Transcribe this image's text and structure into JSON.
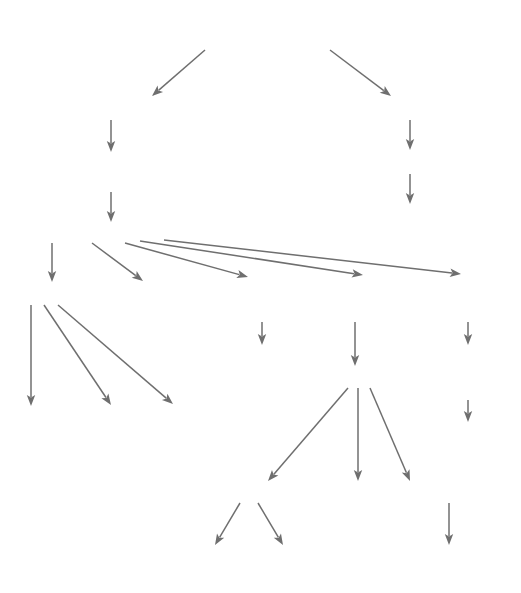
{
  "meta": {
    "background_color": "#ffffff",
    "text_color": "#3b3b3b",
    "title_color": "#4a4a4a",
    "edge_color": "#6f6f6f"
  },
  "chart_data": {
    "type": "diagram",
    "nodes": [
      {
        "id": "cold",
        "label": "local application of cold",
        "x": 262,
        "y": 40,
        "role": "title"
      },
      {
        "id": "bodytemp",
        "label": "↓ body temperature",
        "x": 111,
        "y": 111,
        "role": "node"
      },
      {
        "id": "heatcons",
        "label": "↑ heat-conserving\nmechanisms",
        "x": 111,
        "y": 167,
        "role": "node"
      },
      {
        "id": "vasoconstr",
        "label": "vasoconstriction/retrostasis",
        "x": 111,
        "y": 233,
        "role": "node"
      },
      {
        "id": "nervefiring",
        "label": "↓ nerve firing",
        "x": 410,
        "y": 111,
        "role": "node"
      },
      {
        "id": "musclespasm",
        "label": "↓ muscle spasm",
        "x": 410,
        "y": 165,
        "role": "node"
      },
      {
        "id": "musclepain",
        "label": "↓ muscle pain",
        "x": 410,
        "y": 219,
        "role": "node"
      },
      {
        "id": "metabolism",
        "label": "↓ metabolism",
        "x": 71,
        "y": 296,
        "role": "node"
      },
      {
        "id": "hunting",
        "label": "hunting\nresponse/\nactive\nderivation",
        "x": 175,
        "y": 296,
        "role": "node"
      },
      {
        "id": "jointinfl",
        "label": "↓ joint\ninflammation",
        "x": 267,
        "y": 296,
        "role": "node"
      },
      {
        "id": "inflresp",
        "label": "↓ inflammatory\nresponse",
        "x": 355,
        "y": 296,
        "role": "node"
      },
      {
        "id": "fluidvisc",
        "label": "↓ fluid\nviscosity",
        "x": 470,
        "y": 296,
        "role": "node"
      },
      {
        "id": "jointpain",
        "label": "↓ joint\npain",
        "x": 262,
        "y": 358,
        "role": "node"
      },
      {
        "id": "vasodil",
        "label": "↓ vasodilation",
        "x": 360,
        "y": 379,
        "role": "node"
      },
      {
        "id": "softtissue",
        "label": "↓ soft\ntissue\nelasticity",
        "x": 468,
        "y": 358,
        "role": "node"
      },
      {
        "id": "dexterity",
        "label": "↓ dexterity",
        "x": 468,
        "y": 434,
        "role": "node"
      },
      {
        "id": "breathing",
        "label": "↓ breathing\nrate",
        "x": 58,
        "y": 422,
        "role": "node"
      },
      {
        "id": "heartrate",
        "label": "↓ heart\nrate",
        "x": 130,
        "y": 422,
        "role": "node"
      },
      {
        "id": "hypoxia",
        "label": "↓ secondary\ncell hypoxia",
        "x": 203,
        "y": 422,
        "role": "node"
      },
      {
        "id": "swelling",
        "label": "↓ swelling",
        "x": 249,
        "y": 494,
        "role": "node"
      },
      {
        "id": "bloodloss",
        "label": "↓ blood loss",
        "x": 344,
        "y": 494,
        "role": "node"
      },
      {
        "id": "cellmigr",
        "label": "↓ cell migration",
        "x": 449,
        "y": 494,
        "role": "node"
      },
      {
        "id": "localpain",
        "label": "↓ local pain",
        "x": 207,
        "y": 558,
        "role": "node"
      },
      {
        "id": "immobility",
        "label": "↓ immobility",
        "x": 315,
        "y": 558,
        "role": "node"
      },
      {
        "id": "scarform",
        "label": "↓ scar formation",
        "x": 449,
        "y": 558,
        "role": "node"
      }
    ],
    "edges": [
      {
        "from": "cold",
        "to": "bodytemp",
        "x1": 205,
        "y1": 50,
        "x2": 152,
        "y2": 96
      },
      {
        "from": "cold",
        "to": "nervefiring",
        "x1": 330,
        "y1": 50,
        "x2": 391,
        "y2": 96
      },
      {
        "from": "bodytemp",
        "to": "heatcons",
        "x1": 111,
        "y1": 120,
        "x2": 111,
        "y2": 152
      },
      {
        "from": "heatcons",
        "to": "vasoconstr",
        "x1": 111,
        "y1": 192,
        "x2": 111,
        "y2": 222
      },
      {
        "from": "nervefiring",
        "to": "musclespasm",
        "x1": 410,
        "y1": 120,
        "x2": 410,
        "y2": 150
      },
      {
        "from": "musclespasm",
        "to": "musclepain",
        "x1": 410,
        "y1": 174,
        "x2": 410,
        "y2": 204
      },
      {
        "from": "vasoconstr",
        "to": "metabolism",
        "x1": 52,
        "y1": 243,
        "x2": 52,
        "y2": 282
      },
      {
        "from": "vasoconstr",
        "to": "hunting",
        "x1": 92,
        "y1": 243,
        "x2": 143,
        "y2": 281
      },
      {
        "from": "vasoconstr",
        "to": "jointinfl",
        "x1": 125,
        "y1": 243,
        "x2": 248,
        "y2": 277
      },
      {
        "from": "vasoconstr",
        "to": "inflresp",
        "x1": 140,
        "y1": 241,
        "x2": 363,
        "y2": 275
      },
      {
        "from": "vasoconstr",
        "to": "fluidvisc",
        "x1": 164,
        "y1": 240,
        "x2": 461,
        "y2": 274
      },
      {
        "from": "metabolism",
        "to": "breathing",
        "x1": 31,
        "y1": 305,
        "x2": 31,
        "y2": 406
      },
      {
        "from": "metabolism",
        "to": "heartrate",
        "x1": 44,
        "y1": 305,
        "x2": 111,
        "y2": 405
      },
      {
        "from": "metabolism",
        "to": "hypoxia",
        "x1": 58,
        "y1": 305,
        "x2": 173,
        "y2": 404
      },
      {
        "from": "jointinfl",
        "to": "jointpain",
        "x1": 262,
        "y1": 322,
        "x2": 262,
        "y2": 345
      },
      {
        "from": "inflresp",
        "to": "vasodil",
        "x1": 355,
        "y1": 322,
        "x2": 355,
        "y2": 366
      },
      {
        "from": "fluidvisc",
        "to": "softtissue",
        "x1": 468,
        "y1": 322,
        "x2": 468,
        "y2": 345
      },
      {
        "from": "softtissue",
        "to": "dexterity",
        "x1": 468,
        "y1": 400,
        "x2": 468,
        "y2": 422
      },
      {
        "from": "vasodil",
        "to": "swelling",
        "x1": 348,
        "y1": 388,
        "x2": 268,
        "y2": 481
      },
      {
        "from": "vasodil",
        "to": "bloodloss",
        "x1": 358,
        "y1": 388,
        "x2": 358,
        "y2": 481
      },
      {
        "from": "vasodil",
        "to": "cellmigr",
        "x1": 370,
        "y1": 388,
        "x2": 410,
        "y2": 481
      },
      {
        "from": "swelling",
        "to": "localpain",
        "x1": 240,
        "y1": 503,
        "x2": 215,
        "y2": 545
      },
      {
        "from": "swelling",
        "to": "immobility",
        "x1": 258,
        "y1": 503,
        "x2": 283,
        "y2": 545
      },
      {
        "from": "cellmigr",
        "to": "scarform",
        "x1": 449,
        "y1": 503,
        "x2": 449,
        "y2": 545
      }
    ]
  }
}
